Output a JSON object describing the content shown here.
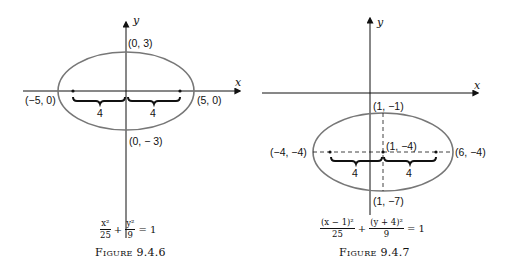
{
  "figures": [
    {
      "id": "fig1",
      "axes": {
        "x_label": "x",
        "y_label": "y"
      },
      "points": {
        "top": "(0, 3)",
        "bottom": "(0, − 3)",
        "left": "(−5, 0)",
        "right": "(5, 0)"
      },
      "brace_labels": [
        "4",
        "4"
      ],
      "equation": {
        "term1_num": "x²",
        "term1_den": "25",
        "plus": "+",
        "term2_num": "y²",
        "term2_den": "9",
        "rhs": "= 1"
      },
      "caption": {
        "word": "Figure",
        "number": "9.4.6"
      }
    },
    {
      "id": "fig2",
      "axes": {
        "x_label": "x",
        "y_label": "y"
      },
      "points": {
        "top": "(1, −1)",
        "center": "(1, −4)",
        "bottom": "(1, −7)",
        "left": "(−4, −4)",
        "right": "(6, −4)"
      },
      "brace_labels": [
        "4",
        "4"
      ],
      "equation": {
        "term1_num": "(x − 1)²",
        "term1_den": "25",
        "plus": "+",
        "term2_num": "(y + 4)²",
        "term2_den": "9",
        "rhs": "= 1"
      },
      "caption": {
        "word": "Figure",
        "number": "9.4.7"
      }
    }
  ],
  "colors": {
    "ellipse": "#777777",
    "axis": "#111111",
    "text": "#111111"
  }
}
